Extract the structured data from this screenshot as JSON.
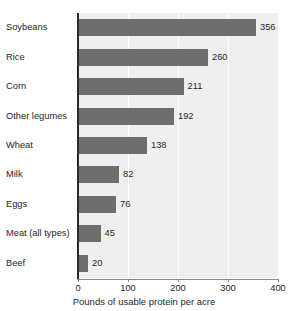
{
  "chart_data": {
    "type": "bar",
    "orientation": "horizontal",
    "title": "",
    "title_note": "clipped at top edge of image, illegible",
    "categories": [
      "Soybeans",
      "Rice",
      "Corn",
      "Other legumes",
      "Wheat",
      "Milk",
      "Eggs",
      "Meat (all types)",
      "Beef"
    ],
    "values": [
      356,
      260,
      211,
      192,
      138,
      82,
      76,
      45,
      20
    ],
    "value_labels": [
      "356",
      "260",
      "211",
      "192",
      "138",
      "82",
      "76",
      "45",
      "20"
    ],
    "xlabel": "Pounds of usable protein per acre",
    "ylabel": "",
    "xlim": [
      0,
      400
    ],
    "xticks": [
      0,
      100,
      200,
      300,
      400
    ],
    "xtick_labels": [
      "0",
      "100",
      "200",
      "300",
      "400"
    ],
    "grid": true,
    "grid_axis": "x",
    "legend": false,
    "colors": {
      "bar_fill": "#6e6e6e",
      "plot_background": "#efefef",
      "gridline": "#ffffff",
      "axis": "#2b2b2b",
      "text": "#1f1f1f",
      "figure_background": "#ffffff"
    }
  }
}
